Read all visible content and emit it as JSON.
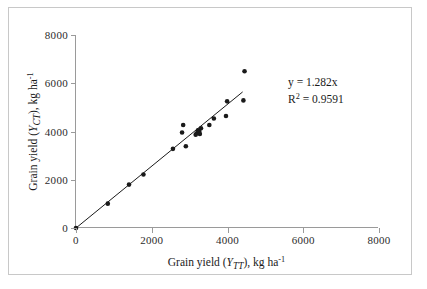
{
  "chart_data": {
    "type": "scatter",
    "title": "",
    "xlabel": "Grain yield (Y_TT), kg ha-1",
    "ylabel": "Grain yield (Y_CT), kg ha-1",
    "xlabel_parts": {
      "prefix": "Grain yield (",
      "symbol": "Y",
      "subscript": "TT",
      "suffix": "), kg ha",
      "superscript": "-1"
    },
    "ylabel_parts": {
      "prefix": "Grain yield (",
      "symbol": "Y",
      "subscript": "CT",
      "suffix": "), kg ha",
      "superscript": "-1"
    },
    "xlim": [
      0,
      8000
    ],
    "ylim": [
      0,
      8000
    ],
    "xticks": [
      0,
      2000,
      4000,
      6000,
      8000
    ],
    "yticks": [
      0,
      2000,
      4000,
      6000,
      8000
    ],
    "xticklabels": [
      "0",
      "2000",
      "4000",
      "6000",
      "8000"
    ],
    "yticklabels": [
      "0",
      "2000",
      "4000",
      "6000",
      "8000"
    ],
    "grid": false,
    "legend": false,
    "marker": "filled-circle",
    "marker_color": "#1a1a1a",
    "points": [
      [
        0,
        0
      ],
      [
        840,
        1010
      ],
      [
        1400,
        1800
      ],
      [
        1780,
        2220
      ],
      [
        2560,
        3280
      ],
      [
        2800,
        3960
      ],
      [
        2830,
        4270
      ],
      [
        2900,
        3390
      ],
      [
        3160,
        3870
      ],
      [
        3190,
        3930
      ],
      [
        3220,
        4050
      ],
      [
        3250,
        4010
      ],
      [
        3270,
        3900
      ],
      [
        3300,
        4130
      ],
      [
        3520,
        4270
      ],
      [
        3640,
        4540
      ],
      [
        3960,
        4640
      ],
      [
        3990,
        5250
      ],
      [
        4420,
        5290
      ],
      [
        4450,
        6500
      ]
    ],
    "trendline": {
      "type": "linear-through-origin",
      "slope": 1.282,
      "intercept": 0,
      "x_start": 0,
      "x_end": 4400
    },
    "annotations": {
      "equation": "y = 1.282x",
      "r_squared_prefix": "R",
      "r_squared_sup": "2",
      "r_squared_value": " = 0.9591"
    }
  }
}
